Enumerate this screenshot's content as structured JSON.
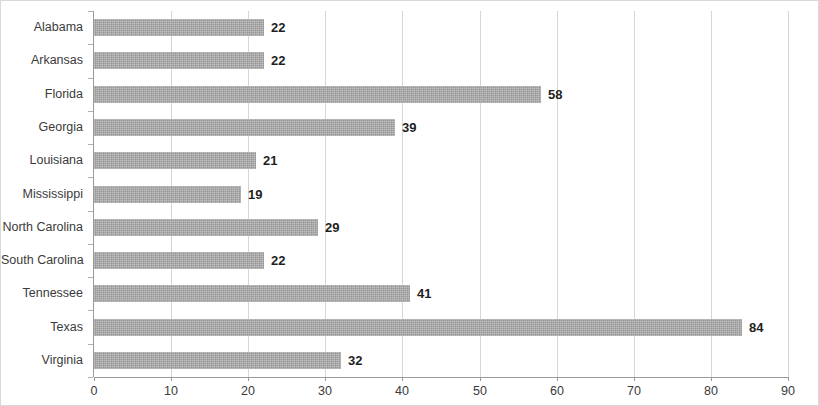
{
  "chart_data": {
    "type": "bar",
    "orientation": "horizontal",
    "title": "",
    "subtitle": "",
    "xlabel": "",
    "ylabel": "",
    "categories": [
      "Alabama",
      "Arkansas",
      "Florida",
      "Georgia",
      "Louisiana",
      "Mississippi",
      "North Carolina",
      "South Carolina",
      "Tennessee",
      "Texas",
      "Virginia"
    ],
    "values": [
      22,
      22,
      58,
      39,
      21,
      19,
      29,
      22,
      41,
      84,
      32
    ],
    "data_labels": [
      "22",
      "22",
      "58",
      "39",
      "21",
      "19",
      "29",
      "22",
      "41",
      "84",
      "32"
    ],
    "xlim": [
      0,
      90
    ],
    "xticks": [
      0,
      10,
      20,
      30,
      40,
      50,
      60,
      70,
      80,
      90
    ],
    "xtick_labels": [
      "0",
      "10",
      "20",
      "30",
      "40",
      "50",
      "60",
      "70",
      "80",
      "90"
    ],
    "grid": true,
    "grid_axis": "x",
    "legend": false,
    "legend_position": "none",
    "series": [
      {
        "name": "",
        "values": [
          22,
          22,
          58,
          39,
          21,
          19,
          29,
          22,
          41,
          84,
          32
        ]
      }
    ],
    "colors": {
      "bar": "#a8a8a8",
      "gridline": "#d6d6d6",
      "axis": "#9a9a9a",
      "label_text": "#3b3b3b",
      "value_text": "#1f1f1f",
      "border": "#d9d9d9",
      "background": "#ffffff"
    }
  }
}
